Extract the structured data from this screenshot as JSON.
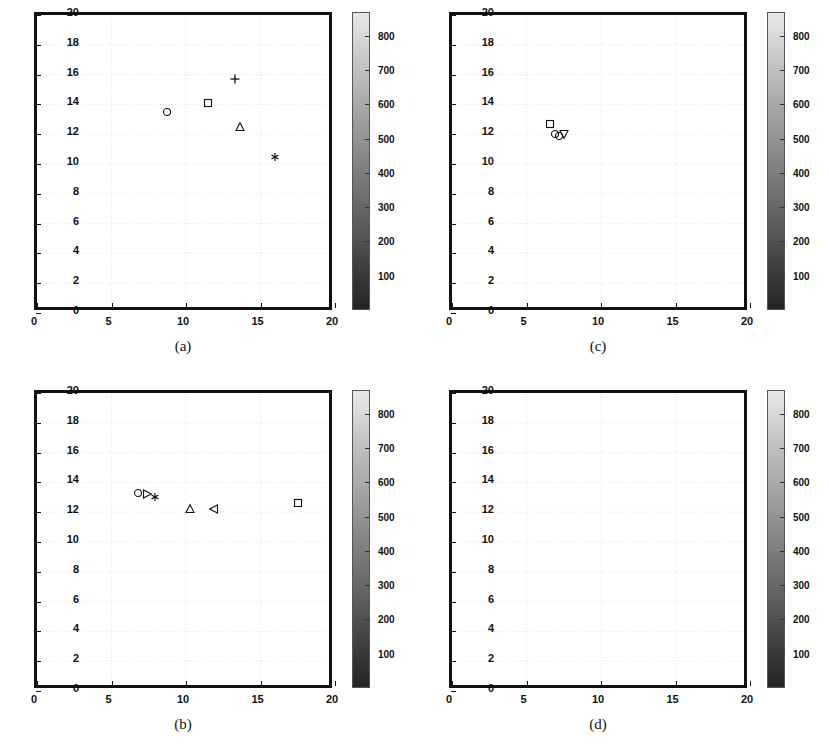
{
  "figure": {
    "panel_count": 4,
    "layout": "2x2"
  },
  "axis": {
    "xlabel": "",
    "ylabel": "",
    "xlim": [
      0,
      20
    ],
    "ylim": [
      0,
      20
    ],
    "xticks": [
      0,
      5,
      10,
      15,
      20
    ],
    "yticks": [
      0,
      2,
      4,
      6,
      8,
      10,
      12,
      14,
      16,
      18,
      20
    ],
    "grid": true
  },
  "colorbar": {
    "ticks": [
      100,
      200,
      300,
      400,
      500,
      600,
      700,
      800
    ],
    "vmin": 0,
    "vmax": 870,
    "colormap": "gray",
    "low_color": "#242424",
    "high_color": "#e8e8e8"
  },
  "panels": [
    {
      "id": "a",
      "caption": "(a)",
      "source": {
        "x": 5.9,
        "y": 12.0
      },
      "markers": [
        {
          "name": "marker-circle",
          "shape": "circle",
          "x": 8.7,
          "y": 13.5
        },
        {
          "name": "marker-square",
          "shape": "square",
          "x": 11.5,
          "y": 14.1
        },
        {
          "name": "marker-plus",
          "shape": "plus",
          "x": 13.3,
          "y": 15.7
        },
        {
          "name": "marker-triangle-up",
          "shape": "triangle-up",
          "x": 13.6,
          "y": 12.5
        },
        {
          "name": "marker-asterisk",
          "shape": "asterisk",
          "x": 16.0,
          "y": 10.5
        },
        {
          "name": "marker-edge-point",
          "shape": "asterisk",
          "x": 20.0,
          "y": 18.3
        }
      ]
    },
    {
      "id": "c",
      "caption": "(c)",
      "source": {
        "x": 5.9,
        "y": 12.0
      },
      "markers": [
        {
          "name": "marker-square",
          "shape": "square",
          "x": 6.6,
          "y": 12.7
        },
        {
          "name": "marker-circle",
          "shape": "circle",
          "x": 6.9,
          "y": 12.0
        },
        {
          "name": "marker-circle-small",
          "shape": "circle",
          "x": 7.2,
          "y": 11.9
        },
        {
          "name": "marker-triangle-down",
          "shape": "triangle-down",
          "x": 7.5,
          "y": 12.0
        }
      ]
    },
    {
      "id": "b",
      "caption": "(b)",
      "source": {
        "x": 5.9,
        "y": 12.0
      },
      "markers": [
        {
          "name": "marker-circle",
          "shape": "circle",
          "x": 6.8,
          "y": 13.3
        },
        {
          "name": "marker-triangle-right",
          "shape": "triangle-right",
          "x": 7.4,
          "y": 13.2
        },
        {
          "name": "marker-asterisk",
          "shape": "asterisk",
          "x": 7.9,
          "y": 13.0
        },
        {
          "name": "marker-triangle-up",
          "shape": "triangle-up",
          "x": 10.3,
          "y": 12.2
        },
        {
          "name": "marker-triangle-left",
          "shape": "triangle-left",
          "x": 11.9,
          "y": 12.2
        },
        {
          "name": "marker-square",
          "shape": "square",
          "x": 17.5,
          "y": 12.6
        }
      ]
    },
    {
      "id": "d",
      "caption": "(d)",
      "source": {
        "x": 5.9,
        "y": 12.0
      },
      "markers": []
    }
  ],
  "chart_data": {
    "type": "contour",
    "title": "",
    "xlabel": "",
    "ylabel": "",
    "xlim": [
      0,
      20
    ],
    "ylim": [
      0,
      20
    ],
    "grid": true,
    "legend_position": "none",
    "colorbar_ticks": [
      100,
      200,
      300,
      400,
      500,
      600,
      700,
      800
    ],
    "colorbar_range": [
      0,
      870
    ],
    "contour_levels": [
      800,
      700,
      600,
      500,
      400,
      300,
      200,
      100,
      50
    ],
    "plume": {
      "origin_x": 5.5,
      "center_y": 12.0,
      "max_extent_x": 20.0,
      "max_half_width_y": 2.0,
      "core_x": 5.9,
      "core_value": 870
    },
    "contour_rings": [
      {
        "level": 800,
        "cx": 6.1,
        "cy": 12.0,
        "rx": 0.55,
        "ry": 0.38
      },
      {
        "level": 700,
        "cx": 6.3,
        "cy": 12.0,
        "rx": 0.85,
        "ry": 0.52
      },
      {
        "level": 600,
        "cx": 6.5,
        "cy": 12.0,
        "rx": 1.15,
        "ry": 0.66
      },
      {
        "level": 500,
        "cx": 6.7,
        "cy": 12.0,
        "rx": 1.5,
        "ry": 0.8
      },
      {
        "level": 400,
        "cx": 7.0,
        "cy": 12.0,
        "rx": 1.95,
        "ry": 0.95
      },
      {
        "level": 300,
        "cx": 7.4,
        "cy": 12.0,
        "rx": 2.5,
        "ry": 1.1
      },
      {
        "level": 200,
        "cx": 8.1,
        "cy": 12.0,
        "rx": 3.4,
        "ry": 1.3
      },
      {
        "level": 100,
        "cx": 9.0,
        "cy": 12.0,
        "rx": 4.5,
        "ry": 1.55
      },
      {
        "level": 50,
        "cx": 11.0,
        "cy": 12.0,
        "rx": 7.2,
        "ry": 1.95
      },
      {
        "level": 25,
        "cx": 12.7,
        "cy": 12.0,
        "rx": 9.0,
        "ry": 2.0
      }
    ]
  }
}
